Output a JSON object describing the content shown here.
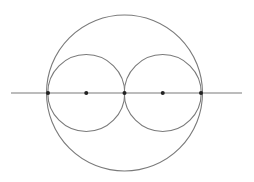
{
  "diagram": {
    "type": "geometric-construction",
    "colors": {
      "background": "#ffffff",
      "stroke": "#7a7a7a",
      "point": "#222222"
    },
    "line": {
      "x1": 11,
      "y1": 93,
      "x2": 242,
      "y2": 93
    },
    "circles": [
      {
        "id": "large-circle",
        "cx": 124.5,
        "cy": 93,
        "r": 78
      },
      {
        "id": "left-small-circle",
        "cx": 86.25,
        "cy": 93,
        "r": 38.5
      },
      {
        "id": "right-small-circle",
        "cx": 162.75,
        "cy": 93,
        "r": 38.5
      }
    ],
    "points": [
      {
        "id": "left-tangent-point",
        "x": 48,
        "y": 93
      },
      {
        "id": "left-center-point",
        "x": 86.25,
        "y": 93
      },
      {
        "id": "middle-tangent-point",
        "x": 124.5,
        "y": 93
      },
      {
        "id": "right-center-point",
        "x": 162.75,
        "y": 93
      },
      {
        "id": "right-tangent-point",
        "x": 201,
        "y": 93
      }
    ]
  }
}
